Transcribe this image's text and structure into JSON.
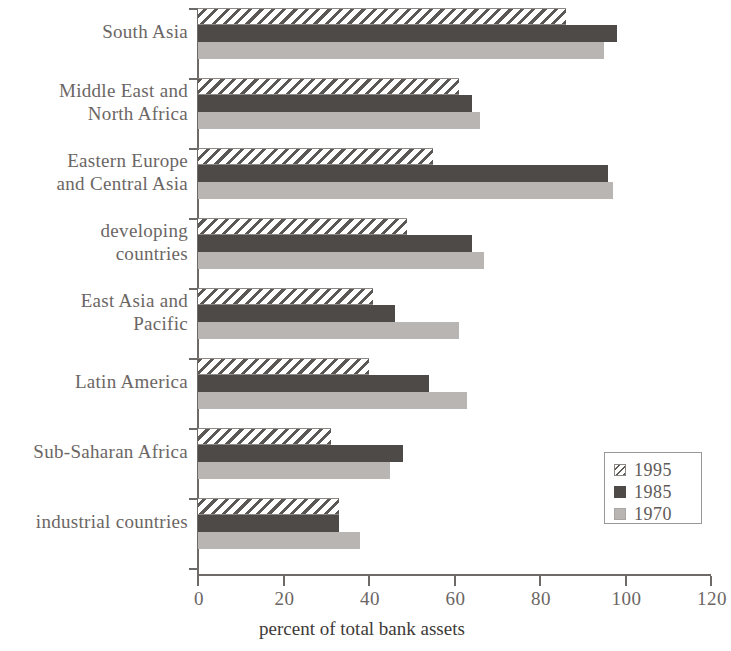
{
  "chart_data": {
    "type": "bar",
    "orientation": "horizontal",
    "title": "",
    "xlabel": "percent of total bank assets",
    "ylabel": "",
    "xlim": [
      0,
      120
    ],
    "xticks": [
      0,
      20,
      40,
      60,
      80,
      100,
      120
    ],
    "xtick_labels": [
      "0",
      "20",
      "40",
      "60",
      "80",
      "100",
      "120"
    ],
    "grid": false,
    "legend_position": "bottom-right",
    "categories": [
      "South Asia",
      "Middle East and North Africa",
      "Eastern Europe and Central Asia",
      "developing countries",
      "East Asia and Pacific",
      "Latin America",
      "Sub-Saharan Africa",
      "industrial countries"
    ],
    "category_lines": [
      [
        "South Asia"
      ],
      [
        "Middle East and",
        "North Africa"
      ],
      [
        "Eastern Europe",
        "and Central Asia"
      ],
      [
        "developing",
        "countries"
      ],
      [
        "East Asia and",
        "Pacific"
      ],
      [
        "Latin America"
      ],
      [
        "Sub-Saharan Africa"
      ],
      [
        "industrial countries"
      ]
    ],
    "series": [
      {
        "name": "1995",
        "style": "hatched",
        "color": "#ffffff",
        "values": [
          86,
          61,
          55,
          49,
          41,
          40,
          31,
          33
        ]
      },
      {
        "name": "1985",
        "style": "solid-dark",
        "color": "#4e4a48",
        "values": [
          98,
          64,
          96,
          64,
          46,
          54,
          48,
          33
        ]
      },
      {
        "name": "1970",
        "style": "solid-light",
        "color": "#b9b5b2",
        "values": [
          95,
          66,
          97,
          67,
          61,
          63,
          45,
          38
        ]
      }
    ]
  },
  "legend": {
    "entries": [
      {
        "label": "1995"
      },
      {
        "label": "1985"
      },
      {
        "label": "1970"
      }
    ]
  }
}
